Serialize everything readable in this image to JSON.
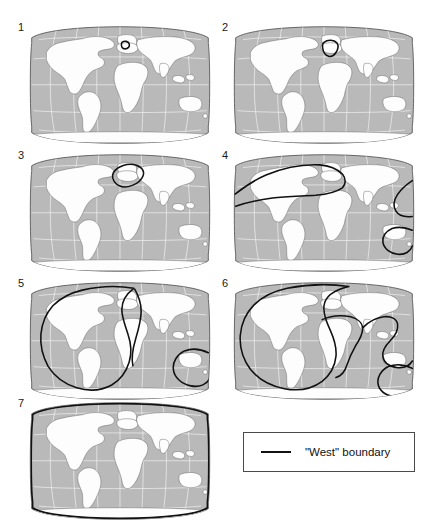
{
  "figure": {
    "type": "map-series",
    "projection": "robinson",
    "panel_count": 7,
    "colors": {
      "ocean": "#b9b9b9",
      "land": "#fdfdfd",
      "graticule": "#f2f2f2",
      "coastline": "#555555",
      "map_outline": "#3d3d3d",
      "boundary": "#111111",
      "background": "#ffffff",
      "legend_border": "#4a4a4a",
      "label": "#1a1a1a"
    },
    "panels": [
      {
        "number": "1",
        "boundary_name": "west-boundary-stage-1"
      },
      {
        "number": "2",
        "boundary_name": "west-boundary-stage-2"
      },
      {
        "number": "3",
        "boundary_name": "west-boundary-stage-3"
      },
      {
        "number": "4",
        "boundary_name": "west-boundary-stage-4"
      },
      {
        "number": "5",
        "boundary_name": "west-boundary-stage-5"
      },
      {
        "number": "6",
        "boundary_name": "west-boundary-stage-6"
      },
      {
        "number": "7",
        "boundary_name": "west-boundary-stage-7"
      }
    ]
  },
  "legend": {
    "label": "\"West\" boundary",
    "swatch": "solid-thick-black-line"
  }
}
